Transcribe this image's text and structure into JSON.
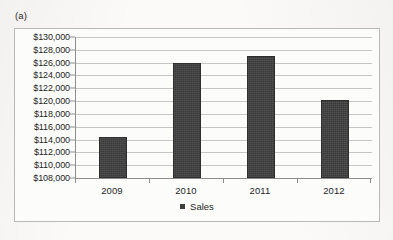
{
  "figure": {
    "label": "(a)"
  },
  "chart_data": {
    "type": "bar",
    "title": "",
    "xlabel": "",
    "ylabel": "",
    "categories": [
      "2009",
      "2010",
      "2011",
      "2012"
    ],
    "values": [
      114400,
      126000,
      127100,
      120100
    ],
    "series": [
      {
        "name": "Sales",
        "values": [
          114400,
          126000,
          127100,
          120100
        ]
      }
    ],
    "ylim": [
      108000,
      130000
    ],
    "ytick_step": 2000,
    "ytick_labels": [
      "$130,000",
      "$128,000",
      "$126,000",
      "$124,000",
      "$122,000",
      "$120,000",
      "$118,000",
      "$116,000",
      "$114,000",
      "$112,000",
      "$110,000",
      "$108,000"
    ],
    "ytick_values": [
      130000,
      128000,
      126000,
      124000,
      122000,
      120000,
      118000,
      116000,
      114000,
      112000,
      110000,
      108000
    ],
    "grid": true,
    "legend": {
      "position": "bottom",
      "entries": [
        "Sales"
      ]
    },
    "bar_color": "#3f3f3f",
    "gridline_color": "#c6c6c6",
    "axis_color": "#8d8d8d"
  }
}
